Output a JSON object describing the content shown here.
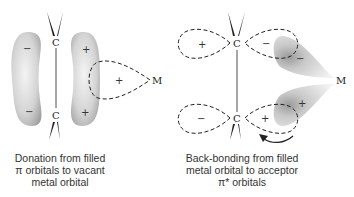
{
  "left_panel": {
    "atom_top": "C",
    "atom_bottom": "C",
    "metal": "M",
    "signs": {
      "left_lobe_top": "−",
      "left_lobe_bottom": "−",
      "right_lobe_top": "+",
      "right_lobe_bottom": "+",
      "metal_orbital": "+"
    },
    "caption": [
      "Donation from filled",
      "π orbitals to vacant",
      "metal orbital"
    ]
  },
  "right_panel": {
    "atom_top": "C",
    "atom_bottom": "C",
    "metal": "M",
    "signs": {
      "top_left_lobe": "+",
      "top_right_lobe": "−",
      "metal_top_lobe": "−",
      "bottom_left_lobe": "−",
      "bottom_right_lobe": "+",
      "metal_bottom_lobe": "+"
    },
    "caption": [
      "Back-bonding from filled",
      "metal orbital to acceptor",
      "π* orbitals"
    ]
  },
  "colors": {
    "lobe_shade_light": "#f2f2f2",
    "lobe_shade_dark": "#a8a8a8",
    "line": "#222222"
  }
}
